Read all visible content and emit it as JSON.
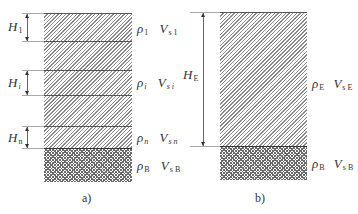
{
  "diagram_a": {
    "caption": "a)",
    "layers": [
      {
        "name": "layer-1",
        "H": "H",
        "H_sub": "1",
        "rho": "ρ",
        "rho_sub": "1",
        "V": "V",
        "V_sub": "s 1"
      },
      {
        "name": "layer-i",
        "H": "H",
        "H_sub": "i",
        "rho": "ρ",
        "rho_sub": "i",
        "V": "V",
        "V_sub": "s i"
      },
      {
        "name": "layer-n",
        "H": "H",
        "H_sub": "n",
        "rho": "ρ",
        "rho_sub": "n",
        "V": "V",
        "V_sub": "s n"
      }
    ],
    "bedrock": {
      "rho": "ρ",
      "rho_sub": "B",
      "V": "V",
      "V_sub": "s B"
    }
  },
  "diagram_b": {
    "caption": "b)",
    "equivalent_layer": {
      "H": "H",
      "H_sub": "E",
      "rho": "ρ",
      "rho_sub": "E",
      "V": "V",
      "V_sub": "s E"
    },
    "bedrock": {
      "rho": "ρ",
      "rho_sub": "B",
      "V": "V",
      "V_sub": "s B"
    }
  },
  "colors": {
    "hatch": "#8a8a8a",
    "bedrock_hatch": "#6a6a6a",
    "line": "#555555"
  }
}
